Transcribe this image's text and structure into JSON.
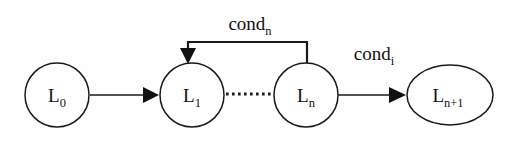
{
  "diagram": {
    "type": "state-transition-loop",
    "background_color": "#fefefe",
    "stroke_color": "#1a1a1a",
    "nodes": [
      {
        "id": "L0",
        "base": "L",
        "subscript": "0",
        "shape": "circle",
        "cx": 57,
        "cy": 95,
        "r": 32
      },
      {
        "id": "L1",
        "base": "L",
        "subscript": "1",
        "shape": "circle",
        "cx": 192,
        "cy": 95,
        "r": 32
      },
      {
        "id": "Ln",
        "base": "L",
        "subscript": "n",
        "shape": "circle",
        "cx": 306,
        "cy": 95,
        "r": 32
      },
      {
        "id": "Ln1",
        "base": "L",
        "subscript": "n+1",
        "shape": "ellipse",
        "cx": 450,
        "cy": 95,
        "rx": 43,
        "ry": 30
      }
    ],
    "edges": [
      {
        "id": "edge-l0-l1",
        "from": "L0",
        "to": "L1",
        "style": "solid-arrow",
        "label": ""
      },
      {
        "id": "edge-l1-ln",
        "from": "L1",
        "to": "Ln",
        "style": "dotted",
        "label": ""
      },
      {
        "id": "edge-ln-ln1",
        "from": "Ln",
        "to": "Ln1",
        "style": "solid-arrow",
        "label_base": "cond",
        "label_subscript": "i"
      },
      {
        "id": "edge-ln-l1-feedback",
        "from": "Ln",
        "to": "L1",
        "style": "orthogonal-arrow",
        "label_base": "cond",
        "label_subscript": "n"
      }
    ],
    "labels": {
      "cond_n": {
        "base": "cond",
        "subscript": "n",
        "x": 250,
        "y": 30
      },
      "cond_i": {
        "base": "cond",
        "subscript": "i",
        "x": 374,
        "y": 60
      }
    }
  }
}
